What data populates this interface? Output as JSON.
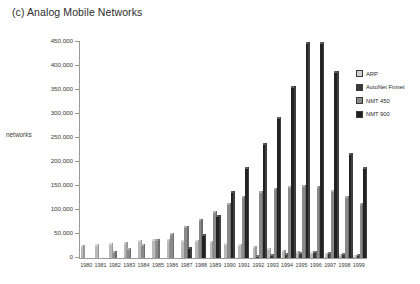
{
  "chart": {
    "title": "(c) Analog Mobile Networks",
    "y_axis_title": "networks"
  },
  "legend": {
    "position": "right",
    "items": [
      {
        "label": "ARP",
        "color": "#d0d0d0"
      },
      {
        "label": "AutoNet Finnet",
        "color": "#3a3a3a"
      },
      {
        "label": "NMT 450",
        "color": "#8a8a8a"
      },
      {
        "label": "NMT 900",
        "color": "#1f1f1f"
      }
    ]
  },
  "chart_data": {
    "type": "bar",
    "title": "(c) Analog Mobile Networks",
    "xlabel": "",
    "ylabel": "networks",
    "ylim": [
      0,
      450000
    ],
    "ytick_labels": [
      "450,000",
      "400,000",
      "350,000",
      "300,000",
      "250,000",
      "200,000",
      "150,000",
      "100,000",
      "50,000",
      "0"
    ],
    "ytick_values": [
      450000,
      400000,
      350000,
      300000,
      250000,
      200000,
      150000,
      100000,
      50000,
      0
    ],
    "grid": false,
    "legend_position": "right",
    "categories": [
      "1980",
      "1981",
      "1982",
      "1983",
      "1984",
      "1985",
      "1986",
      "1987",
      "1988",
      "1989",
      "1990",
      "1991",
      "1992",
      "1993",
      "1994",
      "1995",
      "1996",
      "1997",
      "1998",
      "1999"
    ],
    "series": [
      {
        "name": "ARP",
        "color": "#d0d0d0",
        "values": [
          23000,
          24000,
          27000,
          30000,
          33000,
          35000,
          35000,
          34000,
          33000,
          31000,
          28000,
          24000,
          20000,
          16000,
          13000,
          10000,
          8000,
          6000,
          4000,
          3000
        ]
      },
      {
        "name": "AutoNet Finnet",
        "color": "#3a3a3a",
        "values": [
          0,
          0,
          0,
          0,
          0,
          0,
          0,
          0,
          0,
          0,
          0,
          0,
          3000,
          5000,
          7000,
          9000,
          10000,
          9000,
          7000,
          5000
        ]
      },
      {
        "name": "NMT 450",
        "color": "#8a8a8a",
        "values": [
          0,
          0,
          10000,
          17000,
          25000,
          36000,
          48000,
          62000,
          78000,
          94000,
          110000,
          124000,
          135000,
          142000,
          146000,
          148000,
          146000,
          138000,
          125000,
          110000
        ]
      },
      {
        "name": "NMT 900",
        "color": "#1f1f1f",
        "values": [
          0,
          0,
          0,
          0,
          0,
          0,
          0,
          18000,
          45000,
          85000,
          135000,
          185000,
          235000,
          290000,
          355000,
          445000,
          445000,
          385000,
          215000,
          185000
        ]
      }
    ]
  }
}
